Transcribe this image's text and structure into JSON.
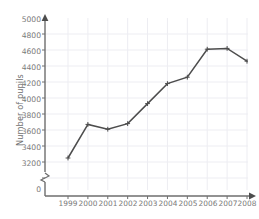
{
  "chart_data": {
    "type": "line",
    "title": "",
    "xlabel": "",
    "ylabel": "Number of pupils",
    "categories": [
      "1999",
      "2000",
      "2001",
      "2002",
      "2003",
      "2004",
      "2005",
      "2006",
      "2007",
      "2008"
    ],
    "values": [
      3450,
      3870,
      3810,
      3880,
      4130,
      4380,
      4460,
      4810,
      4820,
      4660
    ],
    "series": [
      {
        "name": "Number of pupils",
        "values": [
          3450,
          3870,
          3810,
          3880,
          4130,
          4380,
          4460,
          4810,
          4820,
          4660
        ]
      }
    ],
    "ylim": [
      3150,
      5050
    ],
    "y_ticks": [
      3200,
      3400,
      3600,
      3800,
      4000,
      4200,
      4400,
      4600,
      4800,
      5000
    ],
    "y_tick_labels": [
      "3200",
      "3400",
      "3600",
      "3800",
      "4000",
      "4200",
      "4400",
      "4600",
      "4800",
      "5000"
    ],
    "y_origin_label": "0",
    "axis_break": true,
    "grid": true,
    "legend": "none",
    "marker": "plus",
    "line_color": "#4d4d4d",
    "grid_color": "#ededf2",
    "axis_color": "#6e6e6e",
    "text_color": "#7a7a7a",
    "background": "#ffffff"
  }
}
